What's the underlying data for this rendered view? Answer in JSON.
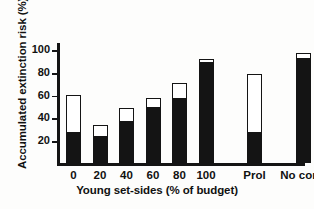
{
  "chart_data": {
    "type": "bar",
    "title": "",
    "xlabel": "Young set-sides (% of budget)",
    "ylabel": "Accumulated extinction risk (%)",
    "categories": [
      "0",
      "20",
      "40",
      "60",
      "80",
      "100",
      "Prol",
      "No cons"
    ],
    "series": [
      {
        "name": "lower (filled)",
        "color": "#141414",
        "values": [
          28,
          24,
          37,
          50,
          58,
          89,
          28,
          93
        ]
      },
      {
        "name": "total (outline)",
        "color": "#ffffff",
        "values": [
          60,
          33,
          48,
          57,
          70,
          91,
          78,
          97
        ]
      }
    ],
    "ylim": [
      0,
      108
    ],
    "yticks": [
      20,
      40,
      60,
      80,
      100
    ],
    "ytick_labels": [
      "20",
      "40",
      "60",
      "80",
      "100"
    ],
    "grid": false,
    "legend": "none",
    "gap_after_category_index": 5
  }
}
